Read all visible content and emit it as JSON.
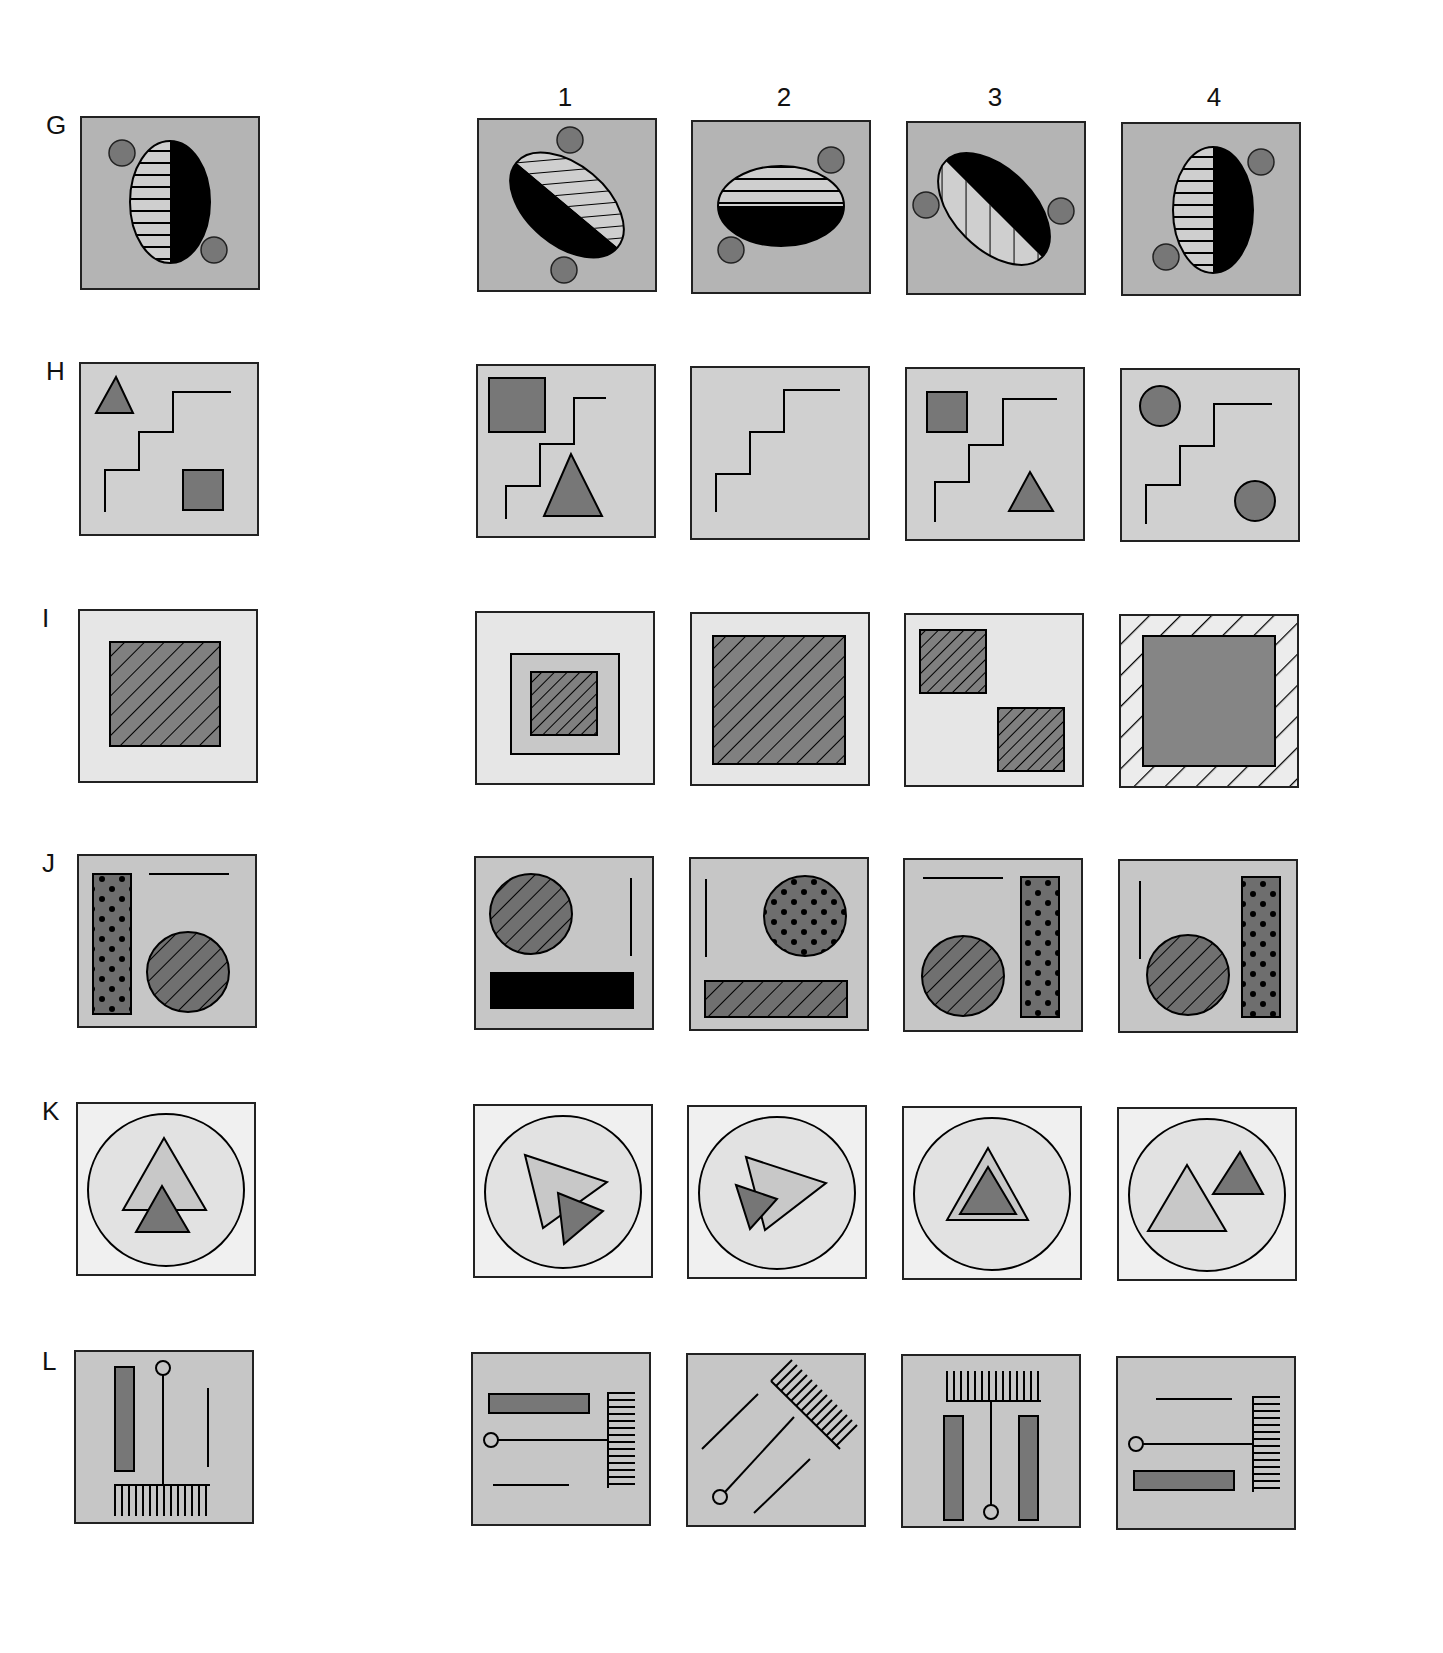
{
  "columns": [
    {
      "label": "1",
      "x": 565
    },
    {
      "label": "2",
      "x": 784
    },
    {
      "label": "3",
      "x": 995
    },
    {
      "label": "4",
      "x": 1214
    }
  ],
  "colors": {
    "bg_dark": "#b4b4b4",
    "bg_mid": "#d0d0d0",
    "bg_light": "#e6e6e6",
    "bg_lightest": "#efefef",
    "fill_dark": "#757575",
    "fill_light": "#cccccc",
    "black": "#000000"
  },
  "rows": [
    {
      "id": "G",
      "label": "G",
      "y": 116,
      "label_y": 110,
      "stimulus": {
        "description": "Vertical ellipse, left half horizontally striped, right half black; small gray circles at upper-left and lower-right"
      },
      "options": [
        {
          "number": "1",
          "description": "Ellipse tilted 45°, upper-left half black, lower-right half diagonally striped; circles at top and bottom"
        },
        {
          "number": "2",
          "description": "Horizontal ellipse, top half horizontally striped, bottom half black; circles at upper-right and lower-left"
        },
        {
          "number": "3",
          "description": "Ellipse tilted -45°, upper-right half black, lower-left striped; circles at left and right"
        },
        {
          "number": "4",
          "description": "Vertical ellipse, left striped, right black; circles at upper-right and lower-left"
        }
      ]
    },
    {
      "id": "H",
      "label": "H",
      "y": 362,
      "label_y": 356,
      "stimulus": {
        "description": "Staircase line; small gray triangle top-left, small gray square bottom-right"
      },
      "options": [
        {
          "number": "1",
          "description": "Staircase; large square top-left, large triangle bottom-right"
        },
        {
          "number": "2",
          "description": "Staircase only"
        },
        {
          "number": "3",
          "description": "Staircase; small square top-left, small triangle bottom-right"
        },
        {
          "number": "4",
          "description": "Staircase; circle top-left, circle bottom-right"
        }
      ]
    },
    {
      "id": "I",
      "label": "I",
      "y": 609,
      "label_y": 603,
      "stimulus": {
        "description": "Diagonally hatched dark square centered in light frame"
      },
      "options": [
        {
          "number": "1",
          "description": "Small hatched square inside medium gray square"
        },
        {
          "number": "2",
          "description": "Large hatched square"
        },
        {
          "number": "3",
          "description": "Two small hatched squares, top-left and bottom-right"
        },
        {
          "number": "4",
          "description": "Solid gray square inside hatched border"
        }
      ]
    },
    {
      "id": "J",
      "label": "J",
      "y": 854,
      "label_y": 848,
      "stimulus": {
        "description": "Dotted vertical bar left, horizontal line top-right, hatched circle bottom-right"
      },
      "options": [
        {
          "number": "1",
          "description": "Hatched circle top-left, vertical line right, black horizontal bar bottom"
        },
        {
          "number": "2",
          "description": "Vertical line left, dotted circle top-right, hatched horizontal bar bottom"
        },
        {
          "number": "3",
          "description": "Horizontal line top-left, hatched circle bottom-left, dotted vertical bar right"
        },
        {
          "number": "4",
          "description": "Vertical line top-left, hatched circle bottom-left, dotted vertical bar right"
        }
      ]
    },
    {
      "id": "K",
      "label": "K",
      "y": 1102,
      "label_y": 1096,
      "stimulus": {
        "description": "Circle with light triangle and smaller dark triangle overlapping below, pointing up"
      },
      "options": [
        {
          "number": "1",
          "description": "Both triangles rotated to point down-left, overlapping"
        },
        {
          "number": "2",
          "description": "Both triangles rotated, dark one in front at left"
        },
        {
          "number": "3",
          "description": "Dark triangle nested inside light triangle"
        },
        {
          "number": "4",
          "description": "Light triangle lower-left, dark triangle upper-right, separated"
        }
      ]
    },
    {
      "id": "L",
      "label": "L",
      "y": 1350,
      "label_y": 1346,
      "stimulus": {
        "description": "Vertical gray bar left, pin with circle on comb at bottom, vertical line right"
      },
      "options": [
        {
          "number": "1",
          "description": "Rotated 90°: horizontal bar top, pin from left to comb on right, line bottom"
        },
        {
          "number": "2",
          "description": "Rotated 45°: diagonal lines, pin to diagonal comb"
        },
        {
          "number": "3",
          "description": "Comb top, pin down to circle at bottom, bars on both sides"
        },
        {
          "number": "4",
          "description": "Line top, pin from left to comb at right, bar bottom"
        }
      ]
    }
  ]
}
